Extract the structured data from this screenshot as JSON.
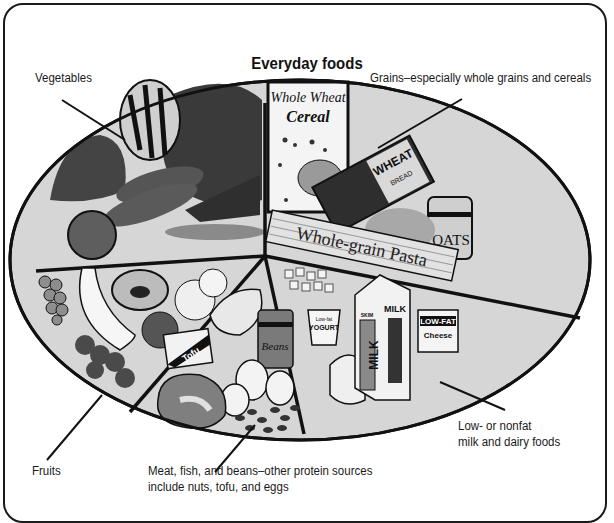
{
  "title": "Everyday foods",
  "labels": {
    "vegetables": "Vegetables",
    "grains": "Grains–especially whole grains and cereals",
    "dairy_line1": "Low- or nonfat",
    "dairy_line2": "milk and dairy foods",
    "fruits": "Fruits",
    "protein_line1": "Meat, fish, and beans–other protein sources",
    "protein_line2": "include nuts, tofu, and eggs"
  },
  "packages": {
    "cereal_line1": "Whole Wheat",
    "cereal_line2": "Cereal",
    "bread_brand": "WHEAT",
    "bread_type": "BREAD",
    "oats": "OATS",
    "pasta": "Whole-grain Pasta",
    "tofu": "Tofu",
    "beans": "Beans",
    "yogurt_line1": "Low-fat",
    "yogurt_line2": "YOGURT",
    "milk_skim": "SKIM",
    "milk": "MILK",
    "cheese_line1": "LOW-FAT",
    "cheese_line2": "Cheese"
  },
  "colors": {
    "plate_fill": "#d6d6d6",
    "outline": "#111111",
    "dark_food": "#3c3c3c",
    "mid_food": "#6e6e6e"
  }
}
